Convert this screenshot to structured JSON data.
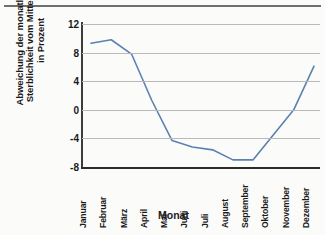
{
  "chart_data": {
    "type": "line",
    "title": "",
    "xlabel": "Monat",
    "ylabel": "Abweichung der monatlichen Sterblichkeit vom Mittelwert in Prozent",
    "ylabel_lines": [
      "Abweichung der monatlichen",
      "Sterblichkeit vom Mittelwert",
      "in Prozent"
    ],
    "categories": [
      "Januar",
      "Februar",
      "März",
      "April",
      "Mai",
      "Juni",
      "Juli",
      "August",
      "September",
      "Oktober",
      "November",
      "Dezember"
    ],
    "values": [
      9.3,
      9.8,
      7.8,
      1.3,
      -4.3,
      -5.2,
      -5.6,
      -7.0,
      -7.0,
      -3.5,
      0.0,
      6.1
    ],
    "series": [
      {
        "name": "Abweichung vom Mittelwert",
        "values": [
          9.3,
          9.8,
          7.8,
          1.3,
          -4.3,
          -5.2,
          -5.6,
          -7.0,
          -7.0,
          -3.5,
          0.0,
          6.1
        ],
        "color": "#5b82b0"
      }
    ],
    "yticks": [
      12,
      8,
      4,
      0,
      -4,
      -8
    ],
    "ytick_labels": [
      "12",
      "8",
      "4",
      "0",
      "-4",
      "-8"
    ],
    "ylim": [
      -8,
      12
    ],
    "grid": true,
    "legend": false,
    "legend_position": "none"
  },
  "style": {
    "line_color": "#5b82b0",
    "grid_color": "#b9b9b9",
    "axis_color": "#2b2b2b",
    "background": "#fbfbfa",
    "text_color": "#1a1a1a"
  }
}
